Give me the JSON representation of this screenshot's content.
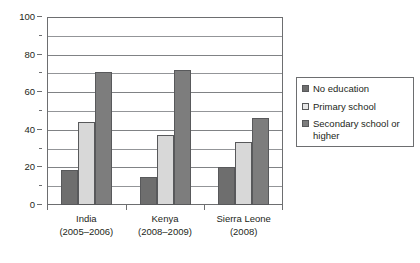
{
  "chart_data": {
    "type": "bar",
    "title": "",
    "subtitle": "",
    "xlabel": "",
    "ylabel": "",
    "ylim": [
      0,
      100
    ],
    "ytick_step": 20,
    "minor_gridline_step": 10,
    "grid": true,
    "legend_position": "right",
    "categories": [
      "India",
      "Kenya",
      "Sierra Leone"
    ],
    "category_periods": [
      "(2005–2006)",
      "(2008–2009)",
      "(2008)"
    ],
    "ytick_labels": [
      "0",
      "20",
      "40",
      "60",
      "80",
      "100"
    ],
    "ytick_values": [
      0,
      20,
      40,
      60,
      80,
      100
    ],
    "series": [
      {
        "name": "No education",
        "color": "#6e6e6e",
        "values": [
          18.5,
          15,
          20
        ]
      },
      {
        "name": "Primary school",
        "color": "#d8d8d8",
        "values": [
          44,
          37,
          33.5
        ]
      },
      {
        "name": "Secondary school or higher",
        "color": "#7d7d7d",
        "values": [
          71,
          72,
          46.5
        ]
      }
    ]
  },
  "legend": {
    "items": [
      {
        "label": "No education"
      },
      {
        "label": "Primary school"
      },
      {
        "label": "Secondary school or higher"
      }
    ]
  },
  "caption": {
    "text": ""
  }
}
